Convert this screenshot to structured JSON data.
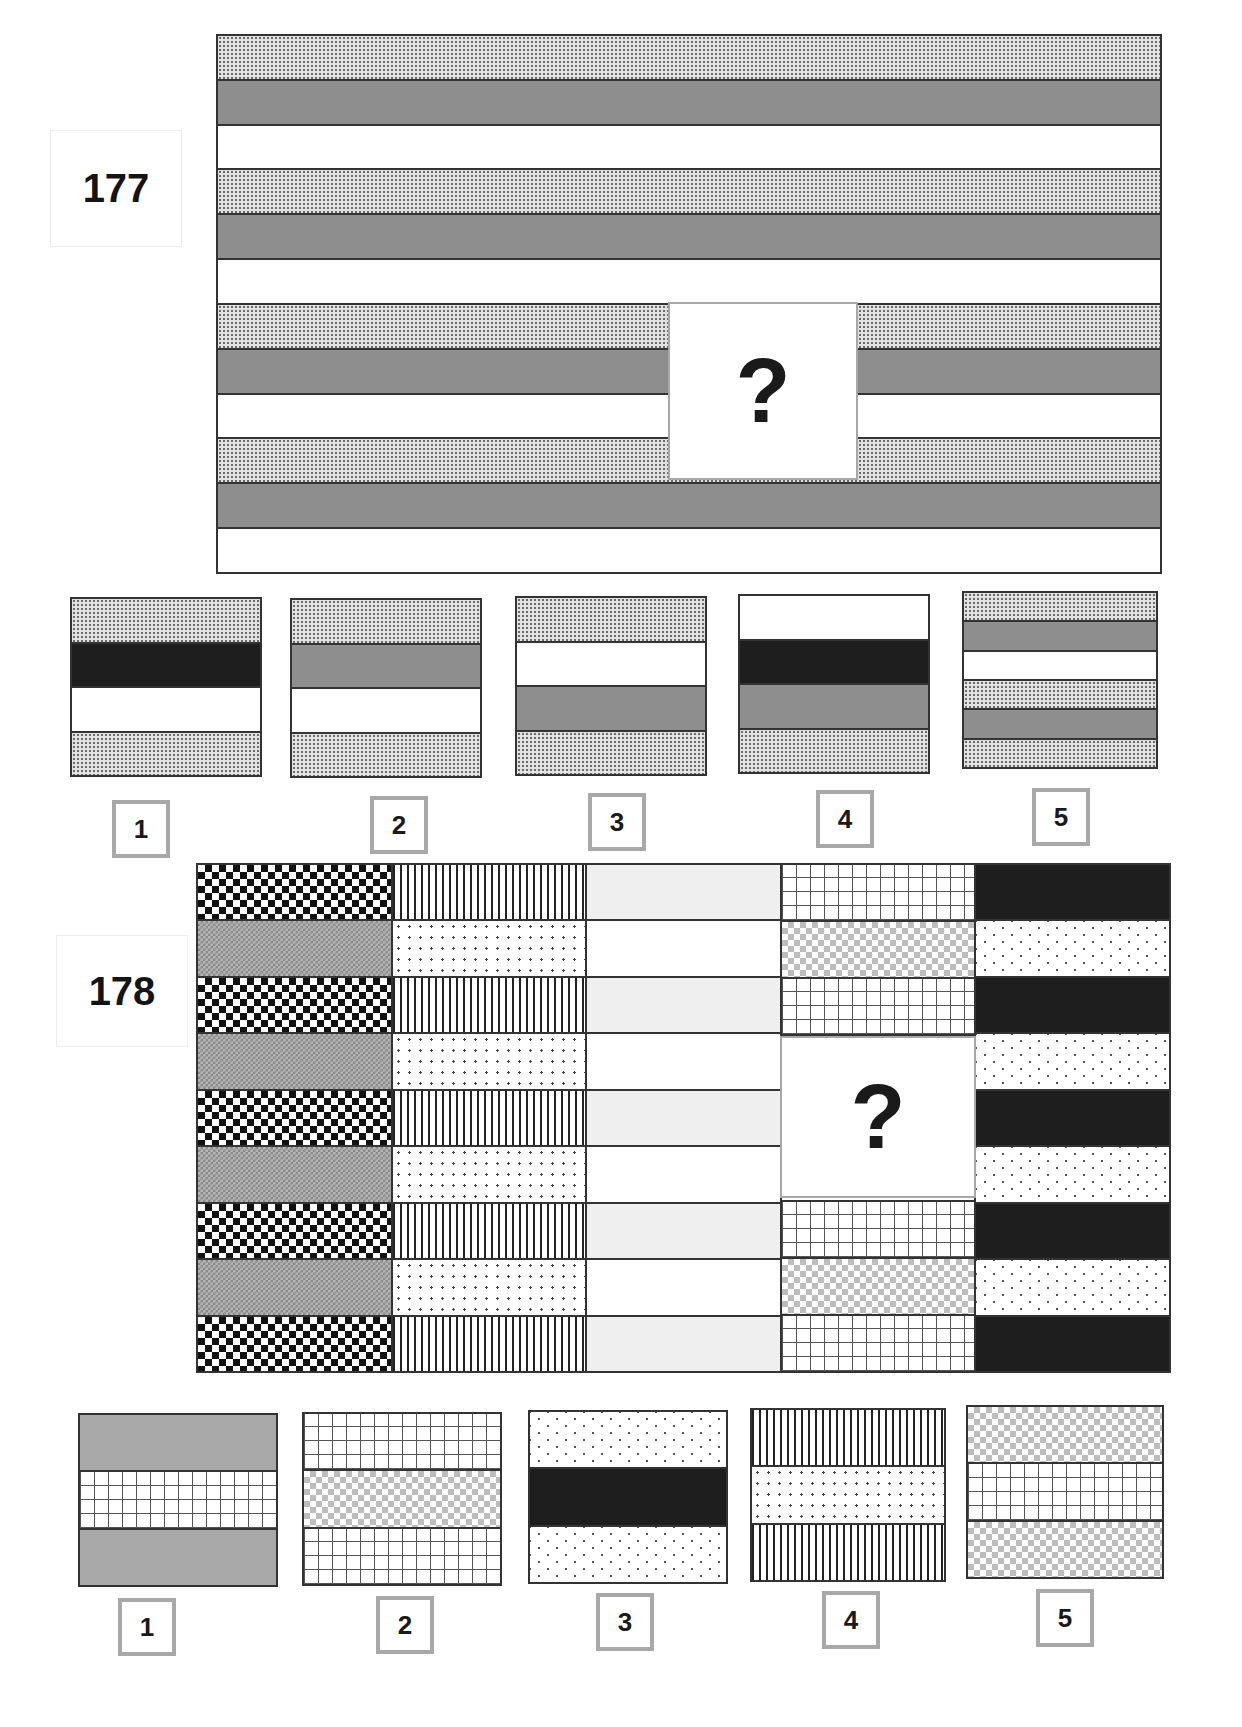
{
  "problems": [
    {
      "number": "177",
      "question_mark": "?",
      "main_pattern": [
        "dots",
        "gray",
        "white",
        "dots",
        "gray",
        "white",
        "dots",
        "gray",
        "white",
        "dots",
        "gray",
        "white"
      ],
      "answer_options": [
        {
          "label": "1",
          "stripes": [
            "dots",
            "black",
            "white",
            "dots"
          ]
        },
        {
          "label": "2",
          "stripes": [
            "dots",
            "gray",
            "white",
            "dots"
          ]
        },
        {
          "label": "3",
          "stripes": [
            "dots",
            "white",
            "gray",
            "dots"
          ]
        },
        {
          "label": "4",
          "stripes": [
            "white",
            "black",
            "gray",
            "dots"
          ]
        },
        {
          "label": "5",
          "stripes": [
            "dots",
            "gray",
            "white",
            "dots",
            "gray",
            "dots"
          ]
        }
      ]
    },
    {
      "number": "178",
      "question_mark": "?",
      "columns": [
        [
          "diamond",
          "cross",
          "diamond",
          "cross",
          "diamond",
          "cross",
          "diamond",
          "cross",
          "diamond"
        ],
        [
          "vlines",
          "sparse",
          "vlines",
          "sparse",
          "vlines",
          "sparse",
          "vlines",
          "sparse",
          "vlines"
        ],
        [
          "paleg",
          "white",
          "paleg",
          "white",
          "paleg",
          "white",
          "paleg",
          "white",
          "paleg"
        ],
        [
          "grid",
          "check",
          "grid",
          "?",
          "?",
          "?",
          "grid",
          "check",
          "grid"
        ],
        [
          "black",
          "chev",
          "black",
          "chev",
          "black",
          "chev",
          "black",
          "chev",
          "black"
        ]
      ],
      "answer_options": [
        {
          "label": "1",
          "stripes": [
            "lgray",
            "grid",
            "lgray"
          ]
        },
        {
          "label": "2",
          "stripes": [
            "grid",
            "check",
            "grid"
          ]
        },
        {
          "label": "3",
          "stripes": [
            "chev",
            "black",
            "chev"
          ]
        },
        {
          "label": "4",
          "stripes": [
            "vlines",
            "sparse",
            "vlines"
          ]
        },
        {
          "label": "5",
          "stripes": [
            "check",
            "grid",
            "check"
          ]
        }
      ]
    }
  ]
}
